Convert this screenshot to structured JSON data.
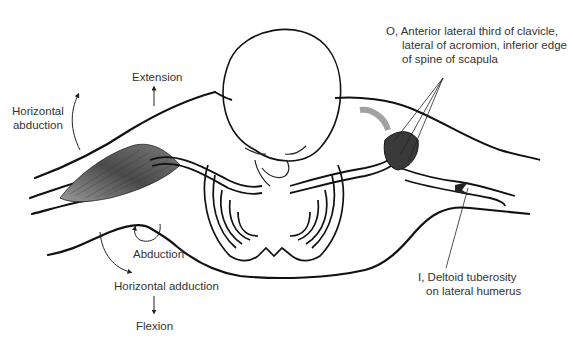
{
  "figure": {
    "colors": {
      "ink": "#1a1a1a",
      "muscle": "#5a5a5a",
      "background": "#ffffff",
      "text": "#333333"
    }
  },
  "labels": {
    "origin": {
      "line1": "O, Anterior lateral third of clavicle,",
      "line2": "lateral of acromion, inferior edge",
      "line3": "of spine of scapula"
    },
    "insertion": {
      "line1": "I, Deltoid tuberosity",
      "line2": "on lateral humerus"
    },
    "actions": {
      "extension": "Extension",
      "horizontal_abduction_1": "Horizontal",
      "horizontal_abduction_2": "abduction",
      "abduction": "Abduction",
      "horizontal_adduction": "Horizontal adduction",
      "flexion": "Flexion"
    }
  }
}
